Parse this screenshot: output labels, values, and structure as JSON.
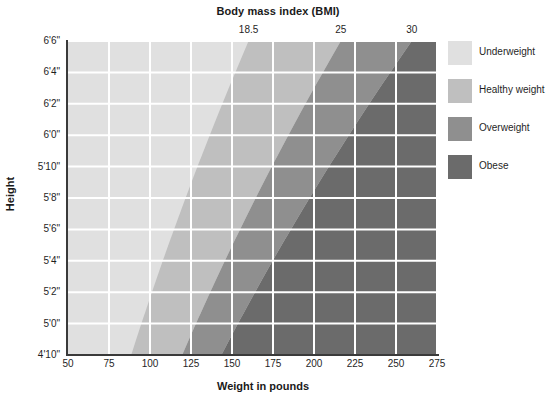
{
  "chart_data": {
    "type": "heatmap",
    "title": "Body mass index (BMI)",
    "xlabel": "Weight in pounds",
    "ylabel": "Height",
    "xlim": [
      50,
      275
    ],
    "ylim_inches": [
      58,
      78
    ],
    "grid": true,
    "legend_position": "right",
    "x_ticks": [
      "50",
      "75",
      "100",
      "125",
      "150",
      "175",
      "200",
      "225",
      "250",
      "275"
    ],
    "x_tick_values": [
      50,
      75,
      100,
      125,
      150,
      175,
      200,
      225,
      250,
      275
    ],
    "y_ticks": [
      "4'10\"",
      "5'0\"",
      "5'2\"",
      "5'4\"",
      "5'6\"",
      "5'8\"",
      "5'10\"",
      "6'0\"",
      "6'2\"",
      "6'4\"",
      "6'6\""
    ],
    "y_tick_inches": [
      58,
      60,
      62,
      64,
      66,
      68,
      70,
      72,
      74,
      76,
      78
    ],
    "bmi_ticks": [
      "18.5",
      "25",
      "30"
    ],
    "bmi_tick_values": [
      18.5,
      25,
      30
    ],
    "bands": [
      {
        "name": "Underweight",
        "bmi_max": 18.5,
        "color": "#e0e0e0"
      },
      {
        "name": "Healthy weight",
        "bmi_min": 18.5,
        "bmi_max": 25,
        "color": "#bfbfbf"
      },
      {
        "name": "Overweight",
        "bmi_min": 25,
        "bmi_max": 30,
        "color": "#8f8f8f"
      },
      {
        "name": "Obese",
        "bmi_min": 30,
        "color": "#6b6b6b"
      }
    ],
    "gridline_color": "#ffffff",
    "axis_color": "#3a3a3a"
  },
  "chart": {
    "top_title": "Body mass index (BMI)",
    "x_title": "Weight in pounds",
    "y_title": "Height"
  },
  "legend": {
    "items": [
      {
        "label": "Underweight",
        "color": "#e0e0e0"
      },
      {
        "label": "Healthy weight",
        "color": "#bfbfbf"
      },
      {
        "label": "Overweight",
        "color": "#8f8f8f"
      },
      {
        "label": "Obese",
        "color": "#6b6b6b"
      }
    ]
  }
}
